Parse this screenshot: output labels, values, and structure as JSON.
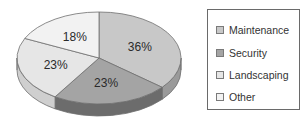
{
  "chart_data": {
    "type": "pie",
    "title": "",
    "style": "3d",
    "categories": [
      "Maintenance",
      "Security",
      "Landscaping",
      "Other"
    ],
    "values": [
      36,
      23,
      23,
      18
    ],
    "labels": [
      "36%",
      "23%",
      "23%",
      "18%"
    ],
    "colors": [
      "#c8c8c8",
      "#a4a4a4",
      "#e6e6e6",
      "#f2f2f2"
    ],
    "side_colors": [
      "#9a9a9a",
      "#6c6c6c",
      "#cfcfcf",
      "#dcdcdc"
    ],
    "legend_position": "right"
  },
  "legend": {
    "items": [
      {
        "label": "Maintenance",
        "color": "#c8c8c8"
      },
      {
        "label": "Security",
        "color": "#a4a4a4"
      },
      {
        "label": "Landscaping",
        "color": "#e6e6e6"
      },
      {
        "label": "Other",
        "color": "#f2f2f2"
      }
    ]
  }
}
